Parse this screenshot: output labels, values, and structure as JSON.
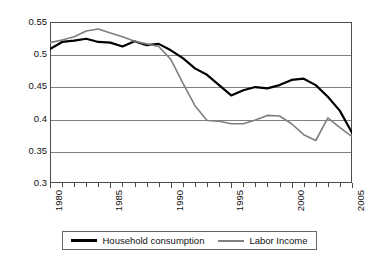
{
  "chart_data": {
    "type": "line",
    "title": "",
    "xlabel": "",
    "ylabel": "",
    "xlim": [
      1980,
      2005
    ],
    "ylim": [
      0.3,
      0.55
    ],
    "grid": true,
    "legend_position": "bottom",
    "x": [
      1980,
      1981,
      1982,
      1983,
      1984,
      1985,
      1986,
      1987,
      1988,
      1989,
      1990,
      1991,
      1992,
      1993,
      1994,
      1995,
      1996,
      1997,
      1998,
      1999,
      2000,
      2001,
      2002,
      2003,
      2004,
      2005
    ],
    "y_ticks": [
      0.3,
      0.35,
      0.4,
      0.45,
      0.5,
      0.55
    ],
    "y_tick_labels": [
      "0.3",
      "0.35",
      "0.4",
      "0.45",
      "0.5",
      "0.55"
    ],
    "x_ticks": [
      1980,
      1981,
      1982,
      1983,
      1984,
      1985,
      1986,
      1987,
      1988,
      1989,
      1990,
      1991,
      1992,
      1993,
      1994,
      1995,
      1996,
      1997,
      1998,
      1999,
      2000,
      2001,
      2002,
      2003,
      2004,
      2005
    ],
    "x_tick_labels": [
      {
        "value": 1980,
        "label": "1980"
      },
      {
        "value": 1985,
        "label": "1985"
      },
      {
        "value": 1990,
        "label": "1990"
      },
      {
        "value": 1995,
        "label": "1995"
      },
      {
        "value": 2000,
        "label": "2000"
      },
      {
        "value": 2005,
        "label": "2005"
      }
    ],
    "series": [
      {
        "name": "Household consumption",
        "color": "#000000",
        "width": 2.2,
        "values": [
          0.508,
          0.519,
          0.521,
          0.524,
          0.519,
          0.518,
          0.512,
          0.52,
          0.514,
          0.516,
          0.506,
          0.494,
          0.478,
          0.468,
          0.452,
          0.436,
          0.444,
          0.449,
          0.447,
          0.452,
          0.46,
          0.462,
          0.452,
          0.434,
          0.412,
          0.378
        ]
      },
      {
        "name": "Labor Income",
        "color": "#7f7f7f",
        "width": 1.6,
        "values": [
          0.518,
          0.522,
          0.527,
          0.536,
          0.539,
          0.533,
          0.527,
          0.52,
          0.516,
          0.512,
          0.492,
          0.455,
          0.42,
          0.397,
          0.396,
          0.392,
          0.392,
          0.398,
          0.405,
          0.404,
          0.392,
          0.375,
          0.366,
          0.401,
          0.386,
          0.372
        ]
      }
    ]
  },
  "legend": {
    "entries": [
      {
        "label": "Household consumption",
        "color": "#000000"
      },
      {
        "label": "Labor Income",
        "color": "#7f7f7f"
      }
    ]
  }
}
